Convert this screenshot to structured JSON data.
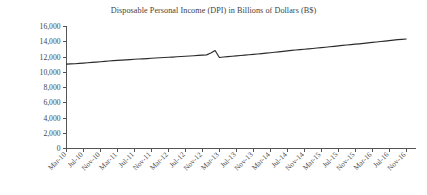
{
  "chart_data": {
    "type": "line",
    "title": "Disposable Personal Income (DPI) in Billions of Dollars (B$)",
    "xlabel": "",
    "ylabel": "",
    "ylim": [
      0,
      16000
    ],
    "ytick_step": 2000,
    "grid": false,
    "legend": false,
    "legend_position": "none",
    "yticks": [
      "0",
      "2,000",
      "4,000",
      "6,000",
      "8,000",
      "10,000",
      "12,000",
      "14,000",
      "16,000"
    ],
    "ytick_values": [
      0,
      2000,
      4000,
      6000,
      8000,
      10000,
      12000,
      14000,
      16000
    ],
    "xtick_labels": [
      "Mar-10",
      "Jul-10",
      "Nov-10",
      "Mar-11",
      "Jul-11",
      "Nov-11",
      "Mar-12",
      "Jul-12",
      "Nov-12",
      "Mar-13",
      "Jul-13",
      "Nov-13",
      "Mar-14",
      "Jul-14",
      "Nov-14",
      "Mar-15",
      "Jul-15",
      "Nov-15",
      "Mar-16",
      "Jul-16",
      "Nov-16"
    ],
    "xtick_rotation_degrees": -45,
    "categories": [
      "Mar-10",
      "Jul-10",
      "Nov-10",
      "Mar-11",
      "Jul-11",
      "Nov-11",
      "Mar-12",
      "Jul-12",
      "Nov-12",
      "Mar-13",
      "Jul-13",
      "Nov-13",
      "Mar-14",
      "Jul-14",
      "Nov-14",
      "Mar-15",
      "Jul-15",
      "Nov-15",
      "Mar-16",
      "Jul-16",
      "Nov-16"
    ],
    "series": [
      {
        "name": "Disposable Personal Income (DPI)",
        "color": "#2b2b2b",
        "values": [
          11060,
          11180,
          11330,
          11530,
          11660,
          11790,
          11960,
          12130,
          12290,
          12420,
          12560,
          12700,
          12870,
          13000,
          13120,
          13280,
          13470,
          13640,
          13880,
          14100,
          14360
        ]
      }
    ],
    "annotations": [
      {
        "label": "spike near Dec-2012",
        "x": "Dec-12",
        "value": 12850,
        "note": "temporary peak followed by dip to about 11,930 in Jan-2013"
      }
    ],
    "monthly_detail": {
      "note": "Monthly series plotted between Mar-2010 and Nov-2016 with a pronounced one-month spike around Dec-2012.",
      "values": [
        11060,
        11090,
        11120,
        11160,
        11200,
        11250,
        11290,
        11330,
        11380,
        11420,
        11470,
        11520,
        11560,
        11590,
        11620,
        11660,
        11700,
        11740,
        11760,
        11790,
        11830,
        11870,
        11900,
        11930,
        11960,
        11990,
        12030,
        12070,
        12100,
        12130,
        12170,
        12210,
        12250,
        12280,
        12520,
        12850,
        11930,
        12000,
        12050,
        12100,
        12150,
        12200,
        12250,
        12300,
        12350,
        12400,
        12450,
        12500,
        12560,
        12620,
        12680,
        12740,
        12800,
        12860,
        12920,
        12970,
        13020,
        13070,
        13120,
        13180,
        13230,
        13280,
        13340,
        13400,
        13460,
        13520,
        13580,
        13630,
        13680,
        13730,
        13790,
        13850,
        13910,
        13970,
        14030,
        14090,
        14150,
        14210,
        14270,
        14320,
        14360
      ]
    }
  }
}
